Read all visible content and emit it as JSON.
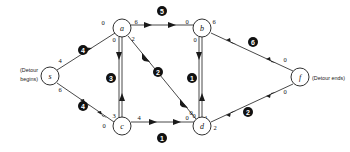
{
  "figure": {
    "type": "network-flow-diagram",
    "background": "#ffffff",
    "stroke_color": "#1a1a1a",
    "badge_color": "#111111",
    "badge_text_color": "#ffffff"
  },
  "annotations": {
    "source_note": "(Detour begins)",
    "source_note_line1": "(Detour",
    "source_note_line2": "begins)",
    "sink_note": "(Detour ends)"
  },
  "nodes": [
    {
      "id": "s",
      "label": "s",
      "x": 50,
      "y": 76
    },
    {
      "id": "a",
      "label": "a",
      "x": 122,
      "y": 29
    },
    {
      "id": "c",
      "label": "c",
      "x": 202,
      "y": 29
    },
    {
      "id": "b",
      "label": "b",
      "x": 122,
      "y": 126
    },
    {
      "id": "d",
      "label": "d",
      "x": 202,
      "y": 126
    },
    {
      "id": "f",
      "label": "f",
      "x": 300,
      "y": 77
    }
  ],
  "edges": [
    {
      "id": "e4-sa",
      "from": "s",
      "to": "a",
      "badge": "4",
      "badge_x": 83,
      "badge_y": 50,
      "tail_value": "4",
      "tail_x": 60,
      "tail_y": 63,
      "head_value": "0",
      "head_x": 103,
      "head_y": 25
    },
    {
      "id": "e4-sb",
      "from": "s",
      "to": "b",
      "badge": "4",
      "badge_x": 83,
      "badge_y": 106,
      "tail_value": "6",
      "tail_x": 60,
      "tail_y": 92,
      "head_value": "0",
      "head_x": 104,
      "head_y": 127
    },
    {
      "id": "e5-ac",
      "from": "a",
      "to": "c",
      "badge": "5",
      "badge_x": 162,
      "badge_y": 12,
      "tail_value": "6",
      "tail_x": 136,
      "tail_y": 25,
      "head_value": "0",
      "head_x": 185,
      "head_y": 25
    },
    {
      "id": "e3-ba",
      "from": "b",
      "to": "a",
      "badge": "3",
      "badge_x": 113,
      "badge_y": 78,
      "tail_value": "3",
      "tail_x": 113,
      "tail_y": 116,
      "head_value": "0",
      "head_x": 113,
      "head_y": 40
    },
    {
      "id": "e2-ad",
      "from": "a",
      "to": "d",
      "badge": "2",
      "badge_x": 158,
      "badge_y": 72,
      "tail_value": "2",
      "tail_x": 133,
      "tail_y": 39,
      "head_value": "0",
      "head_x": 190,
      "head_y": 114
    },
    {
      "id": "e1-dc",
      "from": "d",
      "to": "c",
      "badge": "1",
      "badge_x": 193,
      "badge_y": 78,
      "tail_value": "1",
      "tail_x": 205,
      "tail_y": 117,
      "head_value": "0",
      "head_x": 194,
      "head_y": 40,
      "extra_value": "0",
      "extra_x": 193,
      "extra_y": 117
    },
    {
      "id": "e6-cf",
      "from": "c",
      "to": "f",
      "badge": "6",
      "badge_x": 253,
      "badge_y": 43,
      "tail_value": "6",
      "tail_x": 216,
      "tail_y": 25,
      "head_value": "0",
      "head_x": 283,
      "head_y": 63
    },
    {
      "id": "e2-df",
      "from": "d",
      "to": "f",
      "badge": "2",
      "badge_x": 250,
      "badge_y": 112,
      "tail_value": "2",
      "tail_x": 216,
      "tail_y": 128,
      "head_value": "0",
      "head_x": 283,
      "head_y": 92
    },
    {
      "id": "e1-bd",
      "from": "b",
      "to": "d",
      "badge": "1",
      "badge_x": 162,
      "badge_y": 139,
      "tail_value": "4",
      "tail_x": 140,
      "tail_y": 122,
      "head_value": "0",
      "head_x": 185,
      "head_y": 122
    }
  ],
  "edge_count": 9,
  "node_count": 6
}
